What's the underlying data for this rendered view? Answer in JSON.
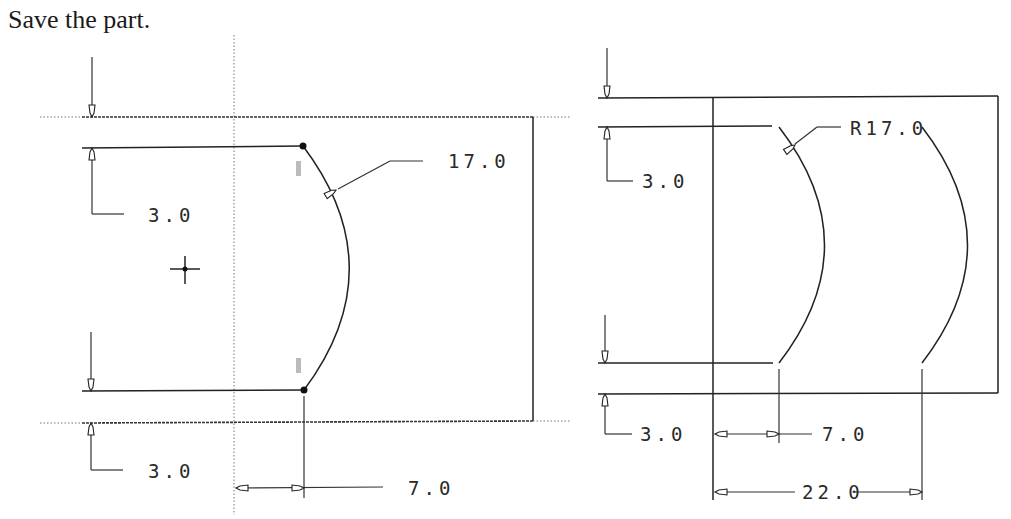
{
  "instruction": {
    "text": "Save the part."
  },
  "left_sketch": {
    "top_offset_label": "3.0",
    "bottom_offset_label": "3.0",
    "arc_radius_label": "17.0",
    "horizontal_offset_label": "7.0",
    "features": [
      "rectangle",
      "vertical-centerline",
      "arc-with-endpoints",
      "origin-crosshair"
    ]
  },
  "right_sketch": {
    "top_offset_label": "3.0",
    "bottom_offset_label": "3.0",
    "arc_radius_label": "R17.0",
    "horizontal_offset_label": "7.0",
    "overall_offset_label": "22.0",
    "features": [
      "rectangle",
      "two-parallel-arcs"
    ]
  },
  "colors": {
    "line": "#222222",
    "background": "#ffffff"
  }
}
